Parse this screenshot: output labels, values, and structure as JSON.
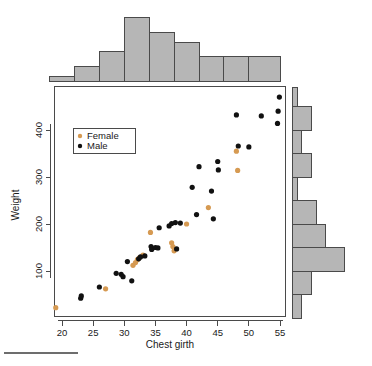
{
  "figure": {
    "kind": "scatter-with-marginal-histograms",
    "background_color": "#ffffff"
  },
  "axes": {
    "x_title": "Chest girth",
    "y_title": "Weight",
    "x_ticks": [
      "20",
      "25",
      "30",
      "35",
      "40",
      "45",
      "50",
      "55"
    ],
    "y_ticks": [
      "100",
      "200",
      "300",
      "400"
    ]
  },
  "legend": {
    "items": [
      {
        "label": "Female",
        "color": "#d69a52",
        "marker": "female-dot-marker"
      },
      {
        "label": "Male",
        "color": "#111111",
        "marker": "male-dot-marker"
      }
    ]
  },
  "chart_data": {
    "type": "scatter",
    "title": "",
    "xlabel": "Chest girth",
    "ylabel": "Weight",
    "xlim": [
      18,
      56
    ],
    "ylim": [
      0,
      490
    ],
    "grid": false,
    "legend_position": "upper-left-inside",
    "colors": {
      "Female": "#d69a52",
      "Male": "#111111"
    },
    "series": [
      {
        "name": "Female",
        "color": "#d69a52",
        "points": [
          [
            19.0,
            22
          ],
          [
            27.0,
            62
          ],
          [
            31.4,
            112
          ],
          [
            31.8,
            118
          ],
          [
            32.1,
            124
          ],
          [
            32.4,
            128
          ],
          [
            33.0,
            134
          ],
          [
            34.2,
            182
          ],
          [
            37.6,
            160
          ],
          [
            37.8,
            152
          ],
          [
            38.0,
            143
          ],
          [
            40.0,
            200
          ],
          [
            43.5,
            235
          ],
          [
            48.0,
            355
          ],
          [
            48.2,
            314
          ]
        ]
      },
      {
        "name": "Male",
        "color": "#111111",
        "points": [
          [
            23.0,
            42
          ],
          [
            23.1,
            47
          ],
          [
            26.0,
            66
          ],
          [
            28.7,
            95
          ],
          [
            29.5,
            93
          ],
          [
            29.8,
            88
          ],
          [
            30.5,
            120
          ],
          [
            31.2,
            79
          ],
          [
            32.3,
            126
          ],
          [
            32.6,
            130
          ],
          [
            33.3,
            132
          ],
          [
            34.3,
            152
          ],
          [
            34.4,
            146
          ],
          [
            35.0,
            150
          ],
          [
            35.4,
            149
          ],
          [
            35.6,
            192
          ],
          [
            37.2,
            196
          ],
          [
            37.6,
            201
          ],
          [
            38.2,
            203
          ],
          [
            38.4,
            147
          ],
          [
            39.0,
            202
          ],
          [
            40.9,
            278
          ],
          [
            41.6,
            220
          ],
          [
            42.0,
            322
          ],
          [
            44.0,
            270
          ],
          [
            44.3,
            211
          ],
          [
            45.0,
            333
          ],
          [
            45.1,
            315
          ],
          [
            48.0,
            432
          ],
          [
            48.3,
            366
          ],
          [
            50.0,
            364
          ],
          [
            52.0,
            430
          ],
          [
            54.6,
            414
          ],
          [
            54.7,
            440
          ],
          [
            54.9,
            470
          ]
        ]
      }
    ],
    "top_histogram": {
      "orientation": "vertical",
      "bin_edges": [
        18,
        22,
        26,
        30,
        34,
        38,
        42,
        46,
        50,
        55
      ],
      "counts": [
        1,
        3,
        6,
        13,
        10,
        8,
        5,
        5,
        5
      ],
      "bar_fill": "#b6b6b6",
      "bar_stroke": "#4a4a4a"
    },
    "right_histogram": {
      "orientation": "horizontal",
      "bin_edges": [
        0,
        50,
        100,
        150,
        200,
        250,
        300,
        350,
        400,
        450,
        490
      ],
      "counts": [
        2,
        4,
        11,
        7,
        5,
        1,
        4,
        2,
        4,
        1
      ],
      "bar_fill": "#b6b6b6",
      "bar_stroke": "#4a4a4a"
    }
  }
}
